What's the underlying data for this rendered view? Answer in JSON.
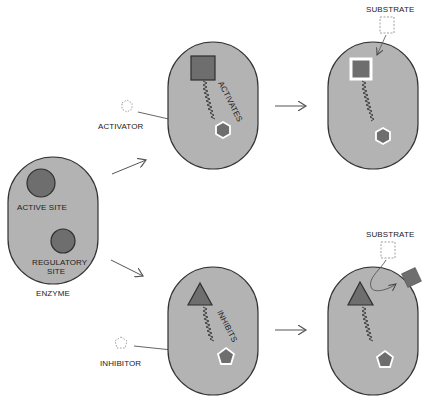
{
  "colors": {
    "enzyme_fill": "#b3b3b3",
    "enzyme_stroke": "#333333",
    "site_fill": "#6e6e6e",
    "site_stroke": "#2e2e2e",
    "arrow": "#555555",
    "text": "#222222",
    "background": "#ffffff"
  },
  "enzyme": {
    "label": "ENZYME",
    "active_site_label": "ACTIVE SITE",
    "regulatory_site_label_line1": "REGULATORY",
    "regulatory_site_label_line2": "SITE"
  },
  "activation": {
    "effector_label": "ACTIVATOR",
    "effector_shape": "hexagon",
    "effect_label": "ACTIVATES",
    "active_site_shape": "square",
    "substrate_label": "SUBSTRATE",
    "substrate_shape": "square",
    "outcome": "substrate binds"
  },
  "inhibition": {
    "effector_label": "INHIBITOR",
    "effector_shape": "pentagon",
    "effect_label": "INHIBITS",
    "active_site_shape": "triangle",
    "substrate_label": "SUBSTRATE",
    "substrate_shape": "square",
    "outcome": "substrate rejected"
  },
  "icons": {
    "flow_arrow": "arrow-right-icon",
    "wavy_signal": "squiggle-line-icon"
  }
}
